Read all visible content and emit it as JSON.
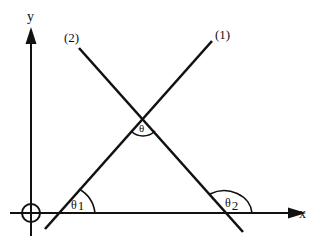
{
  "diagram": {
    "type": "geometry",
    "axes": {
      "x_label": "x",
      "y_label": "y"
    },
    "lines": [
      {
        "id": "line-1",
        "label": "(1)"
      },
      {
        "id": "line-2",
        "label": "(2)"
      }
    ],
    "angles": {
      "theta": "θ",
      "theta1": "θ",
      "theta1_sub": "1",
      "theta2": "θ",
      "theta2_sub": "2"
    },
    "colors": {
      "stroke": "#111111",
      "background": "#ffffff"
    }
  }
}
